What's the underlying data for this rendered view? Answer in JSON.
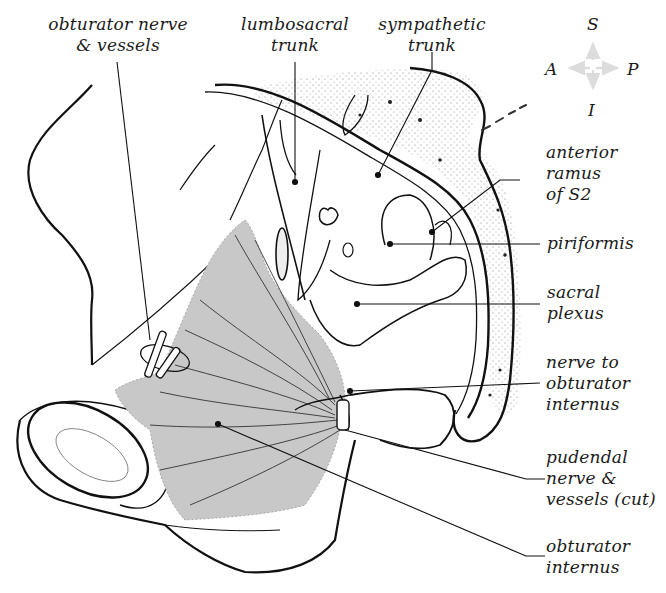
{
  "diagram": {
    "type": "anatomical-illustration",
    "colors": {
      "line": "#111111",
      "muscle_fill": "#c8c8c8",
      "stipple": "#888888",
      "compass_arrow": "#dcdcdc",
      "background": "#ffffff"
    },
    "compass": {
      "superior": "S",
      "inferior": "I",
      "anterior": "A",
      "posterior": "P"
    },
    "labels": {
      "obturator_nerve": {
        "line1": "obturator nerve",
        "line2": "& vessels"
      },
      "lumbosacral_trunk": {
        "line1": "lumbosacral",
        "line2": "trunk"
      },
      "sympathetic_trunk": {
        "line1": "sympathetic",
        "line2": "trunk"
      },
      "anterior_ramus": {
        "line1": "anterior",
        "line2": "ramus",
        "line3": "of S2"
      },
      "piriformis": {
        "line1": "piriformis"
      },
      "sacral_plexus": {
        "line1": "sacral",
        "line2": "plexus"
      },
      "nerve_to_obturator": {
        "line1": "nerve to",
        "line2": "obturator",
        "line3": "internus"
      },
      "pudendal": {
        "line1": "pudendal",
        "line2": "nerve &",
        "line3": "vessels (cut)"
      },
      "obturator_internus": {
        "line1": "obturator",
        "line2": "internus"
      }
    }
  }
}
